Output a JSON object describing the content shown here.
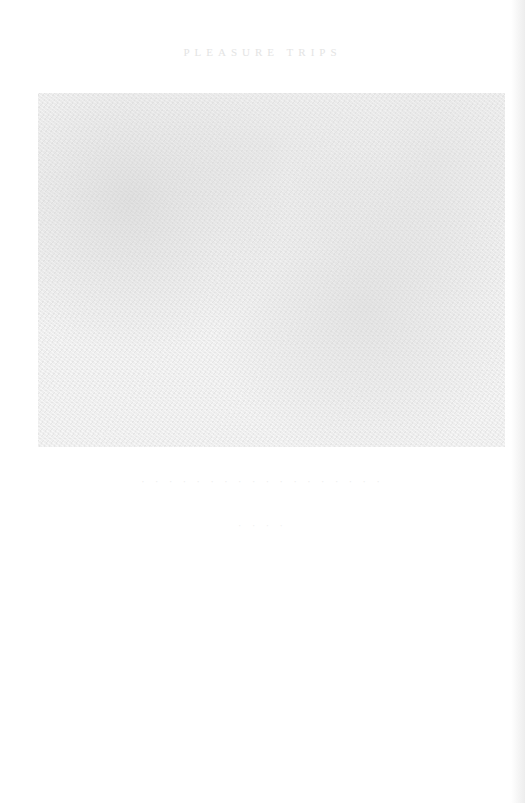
{
  "page": {
    "running_head": "PLEASURE TRIPS",
    "plate": {
      "description": "faded halftone photographic plate"
    },
    "caption": "· · · · · · · · · · · · · · · · · ·",
    "caption_sub": "· · · ·"
  }
}
